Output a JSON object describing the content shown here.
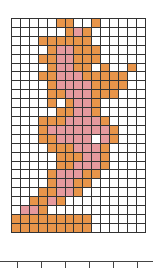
{
  "grid": {
    "cols": 15,
    "rows": 24,
    "colors": {
      "o": "#e8954a",
      "p": "#e69a9e",
      ".": "#ffffff"
    },
    "cells": [
      ".....oo..o.....",
      "......opo......",
      "...oooooo......",
      "....oppooo.....",
      "...ooppooo.....",
      "....oppoo.o..o.",
      "...oopppooooo..",
      "....oppppoooo..",
      "....oopppooo...",
      "....o.oppo.....",
      ".....ooppo.....",
      "...oooppppo....",
      "...opppppppo...",
      "...oopppp.po...",
      "....ooopppo....",
      ".....oooppo....",
      ".....oopppo....",
      "....opppoo.....",
      "....oppoo......",
      "...ooppo.......",
      "..oopo.........",
      ".ppo...........",
      "ooooooooo......",
      "ooooooooo......"
    ]
  },
  "axis": {
    "ticks_x": [
      17,
      41,
      65,
      89,
      113,
      137
    ]
  }
}
